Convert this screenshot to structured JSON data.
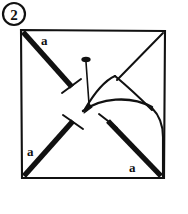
{
  "figure": {
    "kind": "instructional-line-drawing",
    "background_color": "#ffffff",
    "ink_color": "#111111",
    "canvas": {
      "width": 188,
      "height": 214
    }
  },
  "step_badge": {
    "label": "2",
    "shape": "circle",
    "center": {
      "x": 14,
      "y": 14
    },
    "radius": 11
  },
  "sheet": {
    "name": "paper-square",
    "corners": {
      "top_left": {
        "x": 21,
        "y": 30
      },
      "top_right": {
        "x": 165,
        "y": 31
      },
      "bottom_right": {
        "x": 164,
        "y": 178
      },
      "bottom_left": {
        "x": 22,
        "y": 178
      }
    }
  },
  "fold_lines": [
    {
      "name": "fold-line-top-left",
      "label": "a",
      "from_corner": "top_left",
      "weight": "thick",
      "start": {
        "x": 23,
        "y": 32
      },
      "end": {
        "x": 72,
        "y": 87
      },
      "endcap": "t-bar",
      "label_position": {
        "x": 41,
        "y": 45
      }
    },
    {
      "name": "fold-line-bottom-left",
      "label": "a",
      "from_corner": "bottom_left",
      "weight": "thick",
      "start": {
        "x": 24,
        "y": 176
      },
      "end": {
        "x": 72,
        "y": 122
      },
      "endcap": "t-bar",
      "label_position": {
        "x": 27,
        "y": 155
      }
    },
    {
      "name": "fold-line-bottom-right",
      "label": "a",
      "from_corner": "bottom_right",
      "weight": "thick",
      "start": {
        "x": 161,
        "y": 176
      },
      "end": {
        "x": 107,
        "y": 121
      },
      "endcap": "t-bar",
      "label_position": {
        "x": 130,
        "y": 170
      }
    },
    {
      "name": "fold-line-top-right",
      "label": "",
      "from_corner": "top_right",
      "weight": "thin",
      "start": {
        "x": 163,
        "y": 33
      },
      "end": {
        "x": 117,
        "y": 80
      },
      "endcap": "none",
      "label_position": null
    }
  ],
  "pin": {
    "name": "pin",
    "head": {
      "x": 86,
      "y": 60,
      "rx": 4.5,
      "ry": 2.6
    },
    "shaft_start": {
      "x": 86,
      "y": 62
    },
    "shaft_end": {
      "x": 89,
      "y": 105
    },
    "tip": {
      "x": 84,
      "y": 112
    }
  },
  "flap": {
    "name": "folded-flap",
    "peak": {
      "x": 115,
      "y": 76
    },
    "left_edge_end": {
      "x": 85,
      "y": 109
    },
    "right_edge_end": {
      "x": 152,
      "y": 110
    },
    "crease_curve": "arc from (83,110) to (155,108)",
    "right_side_curve": "arc from (152,110) down to (163,134) to (163,178)"
  },
  "labels": {
    "side_label": "a",
    "step_label": "2"
  }
}
